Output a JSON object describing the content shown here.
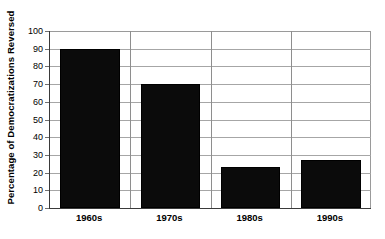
{
  "chart_data": {
    "type": "bar",
    "title": "",
    "subtitle": "",
    "xlabel": "",
    "ylabel": "Percentage of Democratizations Reversed",
    "categories": [
      "1960s",
      "1970s",
      "1980s",
      "1990s"
    ],
    "values": [
      90,
      70,
      23,
      27
    ],
    "series": [
      {
        "name": "Percentage of Democratizations Reversed",
        "values": [
          90,
          70,
          23,
          27
        ]
      }
    ],
    "ylim": [
      0,
      100
    ],
    "y_tick_step": 10,
    "y_ticks": [
      0,
      10,
      20,
      30,
      40,
      50,
      60,
      70,
      80,
      90,
      100
    ],
    "y_tick_labels": [
      "0",
      "10",
      "20",
      "30",
      "40",
      "50",
      "60",
      "70",
      "80",
      "90",
      "100"
    ],
    "grid": "horizontal-and-category-separators",
    "legend": "none",
    "legend_position": "none",
    "bar_color": "#0b0b0b",
    "gridline_color": "#a6a6a6",
    "axis_color": "#3a3a3a",
    "background_color": "#ffffff",
    "annotations": []
  }
}
